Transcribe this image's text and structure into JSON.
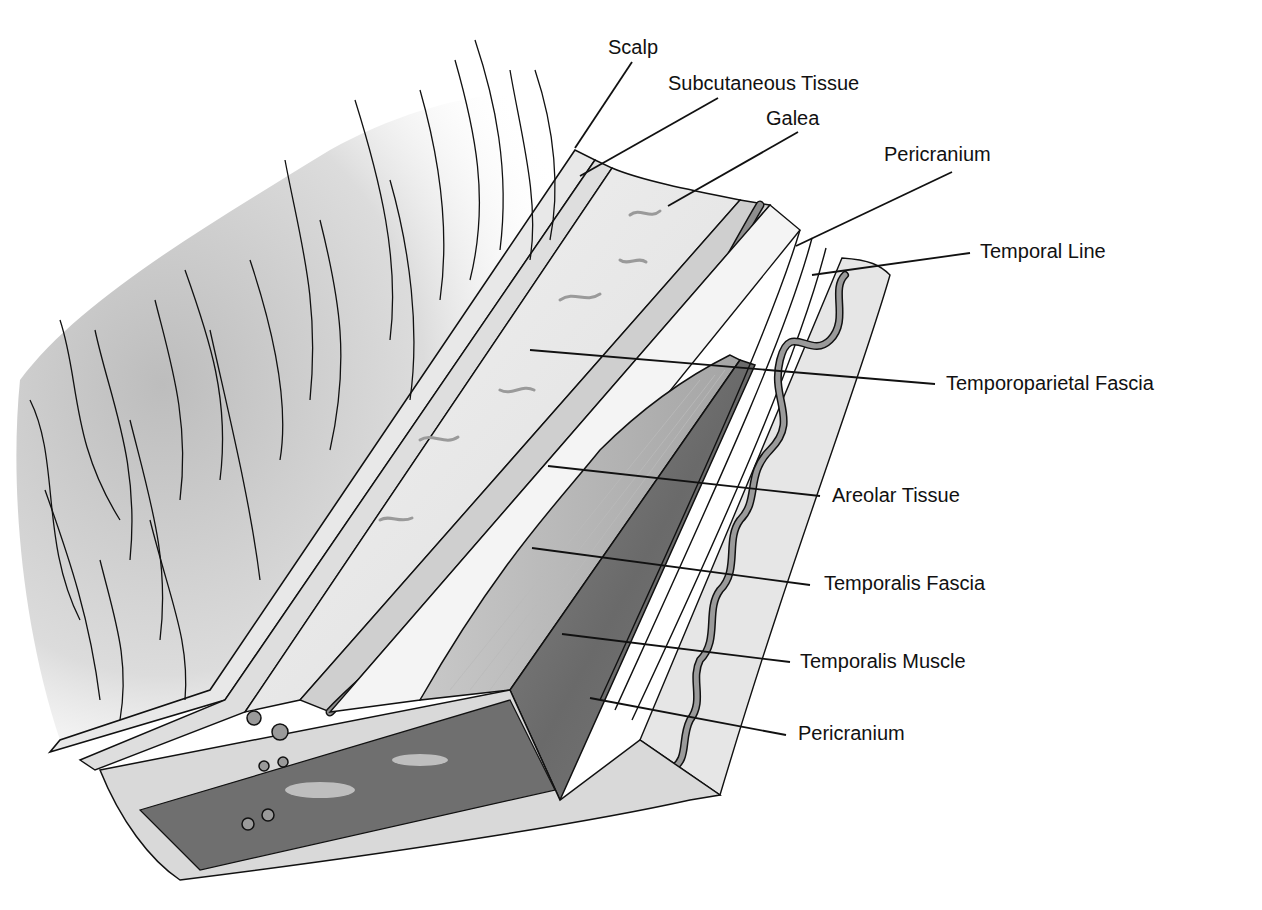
{
  "figure": {
    "type": "anatomical cross-section illustration",
    "style": "grayscale"
  },
  "labels": [
    {
      "id": "scalp",
      "text": "Scalp",
      "x": 608,
      "y": 36,
      "line": {
        "x1": 632,
        "y1": 62,
        "x2": 575,
        "y2": 148
      }
    },
    {
      "id": "subcutaneous",
      "text": "Subcutaneous Tissue",
      "x": 668,
      "y": 72,
      "line": {
        "x1": 718,
        "y1": 98,
        "x2": 580,
        "y2": 176
      }
    },
    {
      "id": "galea",
      "text": "Galea",
      "x": 766,
      "y": 107,
      "line": {
        "x1": 798,
        "y1": 132,
        "x2": 668,
        "y2": 206
      }
    },
    {
      "id": "pericranium_top",
      "text": "Pericranium",
      "x": 884,
      "y": 143,
      "line": {
        "x1": 952,
        "y1": 172,
        "x2": 796,
        "y2": 246
      }
    },
    {
      "id": "temporal_line",
      "text": "Temporal Line",
      "x": 980,
      "y": 240,
      "line": {
        "x1": 970,
        "y1": 253,
        "x2": 812,
        "y2": 275
      }
    },
    {
      "id": "temporoparietal",
      "text": "Temporoparietal Fascia",
      "x": 946,
      "y": 372,
      "line": {
        "x1": 935,
        "y1": 384,
        "x2": 530,
        "y2": 350
      }
    },
    {
      "id": "areolar",
      "text": "Areolar Tissue",
      "x": 832,
      "y": 484,
      "line": {
        "x1": 820,
        "y1": 496,
        "x2": 548,
        "y2": 466
      }
    },
    {
      "id": "temporalis_fascia",
      "text": "Temporalis Fascia",
      "x": 824,
      "y": 572,
      "line": {
        "x1": 810,
        "y1": 585,
        "x2": 532,
        "y2": 548
      }
    },
    {
      "id": "temporalis_muscle",
      "text": "Temporalis Muscle",
      "x": 800,
      "y": 650,
      "line": {
        "x1": 790,
        "y1": 662,
        "x2": 562,
        "y2": 634
      }
    },
    {
      "id": "pericranium_bottom",
      "text": "Pericranium",
      "x": 798,
      "y": 722,
      "line": {
        "x1": 786,
        "y1": 735,
        "x2": 590,
        "y2": 698
      }
    }
  ],
  "colors": {
    "ink": "#111111",
    "skin": "#e4e4e4",
    "fascia": "#d2d2d2",
    "muscle": "#777777",
    "muscle_dark": "#5f5f5f",
    "areolar": "#9a9a9a",
    "vessel": "#8e8e8e",
    "background": "#ffffff"
  }
}
